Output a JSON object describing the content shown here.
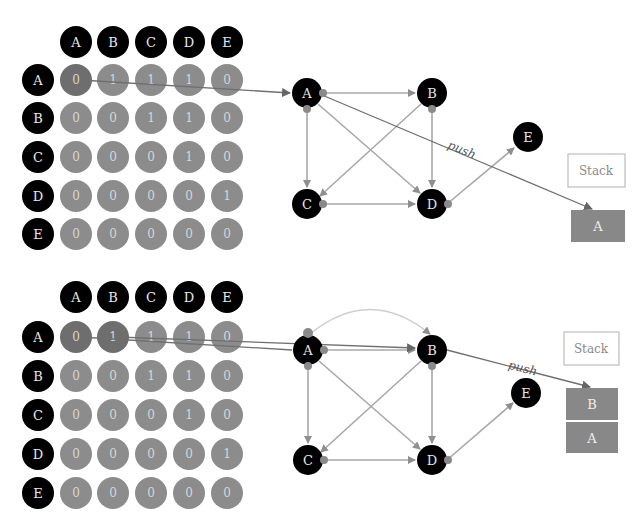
{
  "panels": [
    {
      "id": "step1",
      "matrix": {
        "column_headers": [
          "A",
          "B",
          "C",
          "D",
          "E"
        ],
        "row_headers": [
          "A",
          "B",
          "C",
          "D",
          "E"
        ],
        "rows": [
          [
            "0",
            "1",
            "1",
            "1",
            "0"
          ],
          [
            "0",
            "0",
            "1",
            "1",
            "0"
          ],
          [
            "0",
            "0",
            "0",
            "1",
            "0"
          ],
          [
            "0",
            "0",
            "0",
            "0",
            "1"
          ],
          [
            "0",
            "0",
            "0",
            "0",
            "0"
          ]
        ],
        "highlighted_cells": [
          [
            0,
            0
          ]
        ]
      },
      "graph": {
        "nodes": [
          {
            "label": "A"
          },
          {
            "label": "B"
          },
          {
            "label": "C"
          },
          {
            "label": "D"
          },
          {
            "label": "E"
          }
        ],
        "edges": [
          "A→B",
          "A→C",
          "A→D",
          "B→C",
          "B→D",
          "C→D",
          "D→E"
        ]
      },
      "push_label": "push",
      "stack": {
        "title": "Stack",
        "items": [
          "A"
        ]
      }
    },
    {
      "id": "step2",
      "matrix": {
        "column_headers": [
          "A",
          "B",
          "C",
          "D",
          "E"
        ],
        "row_headers": [
          "A",
          "B",
          "C",
          "D",
          "E"
        ],
        "rows": [
          [
            "0",
            "1",
            "1",
            "1",
            "0"
          ],
          [
            "0",
            "0",
            "1",
            "1",
            "0"
          ],
          [
            "0",
            "0",
            "0",
            "1",
            "0"
          ],
          [
            "0",
            "0",
            "0",
            "0",
            "1"
          ],
          [
            "0",
            "0",
            "0",
            "0",
            "0"
          ]
        ],
        "highlighted_cells": [
          [
            0,
            0
          ],
          [
            0,
            1
          ]
        ]
      },
      "graph": {
        "nodes": [
          {
            "label": "A"
          },
          {
            "label": "B"
          },
          {
            "label": "C"
          },
          {
            "label": "D"
          },
          {
            "label": "E"
          }
        ],
        "edges": [
          "A→B",
          "A→C",
          "A→D",
          "B→C",
          "B→D",
          "C→D",
          "D→E"
        ]
      },
      "push_label": "push",
      "stack": {
        "title": "Stack",
        "items": [
          "B",
          "A"
        ]
      }
    }
  ],
  "colors": {
    "header_fill": "#000000",
    "cell_fill": "#8c8c8c",
    "cell_active_fill": "#6e6e6e",
    "edge": "#a8a8a8",
    "push_line": "#6f6f6f",
    "stack_item_fill": "#888888"
  }
}
